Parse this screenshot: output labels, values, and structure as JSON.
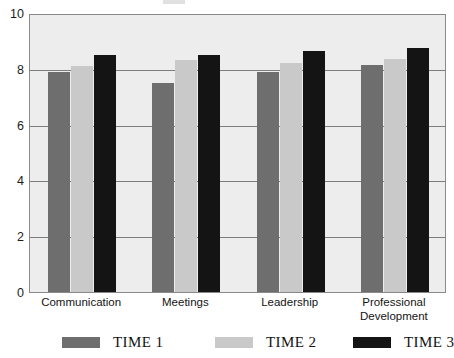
{
  "chart_data": {
    "type": "bar",
    "title": "",
    "xlabel": "",
    "ylabel": "",
    "ylim": [
      0,
      10
    ],
    "yticks": [
      0,
      2,
      4,
      6,
      8,
      10
    ],
    "ytick_labels": [
      "0",
      "2",
      "4",
      "6",
      "8",
      "10"
    ],
    "grid": true,
    "legend_position": "bottom",
    "categories": [
      "Communication",
      "Meetings",
      "Leadership",
      "Professional Development"
    ],
    "series": [
      {
        "name": "TIME 1",
        "color": "#6e6e6e",
        "values": [
          7.9,
          7.5,
          7.9,
          8.15
        ]
      },
      {
        "name": "TIME 2",
        "color": "#c9c9c9",
        "values": [
          8.1,
          8.3,
          8.2,
          8.35
        ]
      },
      {
        "name": "TIME 3",
        "color": "#141414",
        "values": [
          8.5,
          8.5,
          8.65,
          8.75
        ]
      }
    ]
  },
  "style": {
    "plot_background": "#ededed",
    "plot_border": "#8a8a8a",
    "gridline_color": "#7d7d7d",
    "text_color": "#141414"
  }
}
